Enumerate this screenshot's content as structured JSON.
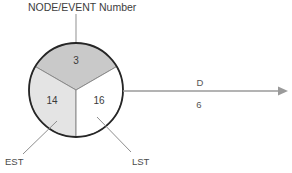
{
  "diagram": {
    "title": "NODE/EVENT Number",
    "node": {
      "event_number": "3",
      "est_value": "14",
      "lst_value": "16",
      "est_label": "EST",
      "lst_label": "LST"
    },
    "edge": {
      "name_label": "D",
      "duration_label": "6"
    },
    "colors": {
      "event_sector_fill": "#c9c9c9",
      "est_sector_fill": "#e4e4e4",
      "lst_sector_fill": "#ffffff",
      "circle_stroke": "#2b2b2b",
      "divider_stroke": "#7d7d7d",
      "leader_stroke": "#8e8e8e",
      "arrow_stroke": "#9a9a9a",
      "text": "#3a3a3a"
    }
  }
}
